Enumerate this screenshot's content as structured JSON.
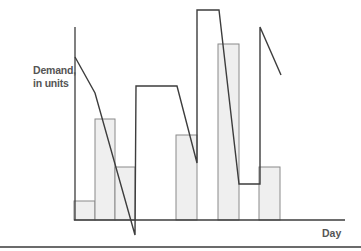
{
  "chart_data": {
    "type": "bar",
    "title": "",
    "xlabel": "Day",
    "ylabel": "Demand, in units",
    "ylabel_lines": [
      "Demand,",
      "in units"
    ],
    "ylim": [
      0,
      100
    ],
    "grid": false,
    "legend": null,
    "categories": [
      "Day 1",
      "Day 2",
      "Day 3",
      "Day 4",
      "Day 5",
      "Day 6",
      "Day 7",
      "Day 8",
      "Day 9",
      "Day 10",
      "Day 11",
      "Day 12",
      "Day 13"
    ],
    "series": [
      {
        "name": "Demand",
        "type": "bar",
        "values": [
          10,
          52,
          27,
          null,
          null,
          44,
          null,
          91,
          null,
          27,
          null,
          null,
          null
        ]
      },
      {
        "name": "Inventory / supply line",
        "type": "line",
        "points": [
          [
            0,
            85
          ],
          [
            1,
            66
          ],
          [
            3,
            -8
          ],
          [
            3,
            69
          ],
          [
            5,
            69
          ],
          [
            6,
            30
          ],
          [
            6,
            109
          ],
          [
            7,
            109
          ],
          [
            8,
            19
          ],
          [
            9,
            19
          ],
          [
            9,
            100
          ],
          [
            10,
            75
          ]
        ]
      }
    ],
    "bars_px": [
      {
        "x": 74,
        "w": 21,
        "top": 201
      },
      {
        "x": 95,
        "w": 20,
        "top": 119
      },
      {
        "x": 115,
        "w": 20,
        "top": 167
      },
      {
        "x": 176,
        "w": 21,
        "top": 135
      },
      {
        "x": 218,
        "w": 21,
        "top": 44
      },
      {
        "x": 259,
        "w": 21,
        "top": 167
      }
    ],
    "line_px": [
      [
        75,
        57
      ],
      [
        95,
        93
      ],
      [
        135,
        235
      ],
      [
        136,
        86
      ],
      [
        177,
        86
      ],
      [
        197,
        163
      ],
      [
        197,
        10
      ],
      [
        219,
        10
      ],
      [
        239,
        184
      ],
      [
        260,
        184
      ],
      [
        260,
        27
      ],
      [
        281,
        75
      ]
    ],
    "axes_px": {
      "y_axis": {
        "x": 75,
        "y1": 27,
        "y2": 220
      },
      "x_axis": {
        "y": 220,
        "x1": 74,
        "x2": 345
      }
    },
    "colors": {
      "bar_fill": "#efefef",
      "bar_stroke": "#8a8a8a",
      "line": "#3d3d3d",
      "axis": "#3d3d3d",
      "label": "#555555"
    }
  },
  "labels": {
    "ylabel_line1": "Demand,",
    "ylabel_line2": "in units",
    "xlabel": "Day"
  }
}
